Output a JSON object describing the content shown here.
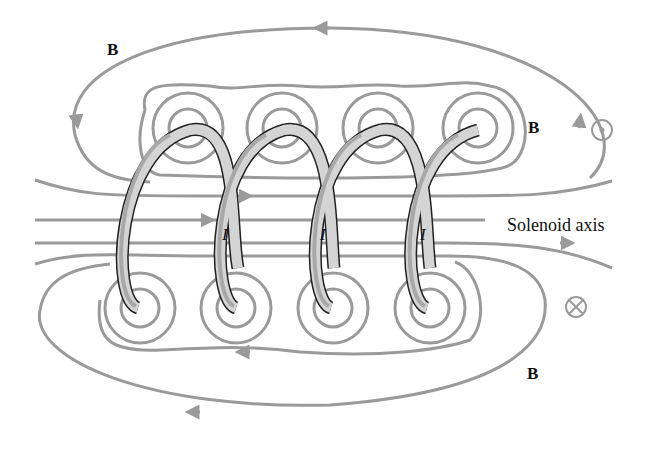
{
  "diagram": {
    "labels": {
      "field_top_left": "B",
      "field_top_right": "B",
      "field_bottom": "B",
      "current_1": "I",
      "current_2": "I",
      "current_3": "I",
      "axis": "Solenoid axis"
    },
    "symbols": {
      "out_of_page": "dot-in-circle",
      "into_page": "cross-in-circle"
    },
    "colors": {
      "field_line": "#9a9a9a",
      "wire_fill": "#d4d4d4",
      "wire_shade": "#a8a8a8",
      "wire_outline": "#222222",
      "text": "#111111"
    },
    "turns": 4
  }
}
